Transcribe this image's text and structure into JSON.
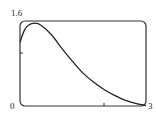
{
  "chart_data": {
    "type": "line",
    "title": "",
    "xlabel": "",
    "ylabel": "",
    "xlim": [
      0,
      3
    ],
    "ylim": [
      0,
      1.6
    ],
    "grid": false,
    "legend": null,
    "tick_labels": {
      "y_top": "1.6",
      "y_bottom": "0",
      "x_right": "3"
    },
    "unlabeled_ticks": {
      "x": [
        2
      ],
      "y": [
        1.0
      ]
    },
    "series": [
      {
        "name": "curve",
        "x": [
          0,
          0.1,
          0.2,
          0.36,
          0.5,
          0.75,
          1.0,
          1.25,
          1.5,
          1.75,
          2.0,
          2.25,
          2.5,
          2.75,
          3.0
        ],
        "y": [
          1.2,
          1.42,
          1.52,
          1.56,
          1.52,
          1.34,
          1.08,
          0.84,
          0.62,
          0.45,
          0.31,
          0.2,
          0.11,
          0.05,
          0.01
        ]
      }
    ]
  }
}
